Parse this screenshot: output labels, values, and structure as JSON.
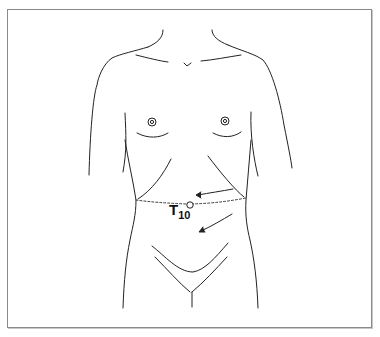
{
  "diagram": {
    "type": "anatomical line drawing",
    "label": {
      "main": "T",
      "subscript": "10"
    },
    "landmark": "umbilicus / T10 dermatome level",
    "arrows": 2,
    "colors": {
      "line": "#222222",
      "frame": "#8a8a8a",
      "background": "#ffffff"
    }
  }
}
